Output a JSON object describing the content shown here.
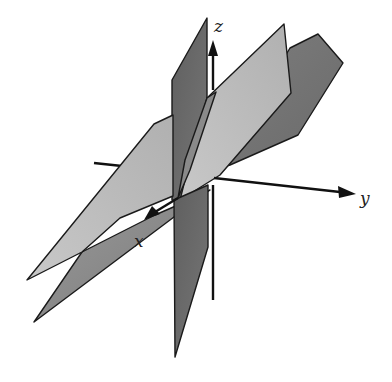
{
  "diagram": {
    "axes": {
      "z": {
        "label": "z"
      },
      "y": {
        "label": "y"
      },
      "x": {
        "label": "x"
      }
    },
    "colors": {
      "background": "#ffffff",
      "dark_plane": "#6b6b6b",
      "mid_plane": "#8e8e8e",
      "light_plane": "#bdbdbd",
      "edge": "#1a1a1a",
      "axis": "#111111"
    },
    "planes": [
      {
        "name": "vertical-plane",
        "shade": "dark"
      },
      {
        "name": "back-tilted-plane",
        "shade": "mid"
      },
      {
        "name": "front-tilted-plane",
        "shade": "light"
      }
    ]
  }
}
